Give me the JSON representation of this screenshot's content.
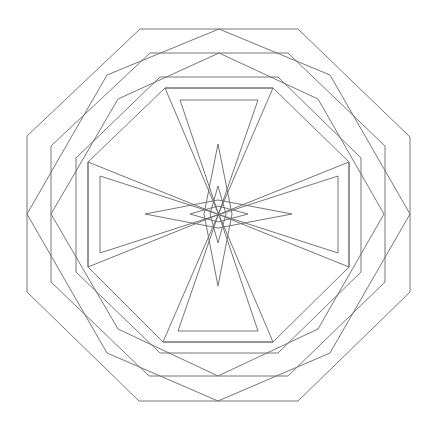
{
  "figure": {
    "stroke_color": "#666666",
    "background": "#ffffff",
    "shapes": [
      {
        "name": "outer-octagon",
        "points": "140,29 298,29 410,137 410,292 298,401 139,401 27,292 27,136"
      },
      {
        "name": "outer-rotated-octagon",
        "points": "219,29 330,75 410,214 330,353 218,401 107,353 27,214 107,75"
      },
      {
        "name": "second-octagon",
        "points": "150,53 288,53 385,146 385,282 288,376 149,376 51,282 51,146"
      },
      {
        "name": "second-rotated-octagon",
        "points": "219,53 318,99 384,214 318,329 218,376 118,329 51,214 118,99"
      },
      {
        "name": "third-octagon",
        "points": "160,77 278,77 361,158 361,272 278,353 160,353 76,272 76,158"
      },
      {
        "name": "fourth-octagon",
        "points": "165,88 273,88 349,162 349,267 273,342 163,342 88,267 88,162"
      },
      {
        "name": "vertical-hourglass-outer",
        "points": "165,88 273,88 163,342 273,342"
      },
      {
        "name": "vertical-hourglass-inner",
        "points": "180,100 258,100 178,331 258,331"
      },
      {
        "name": "horizontal-hourglass-outer",
        "points": "88,162 88,267 349,162 349,267"
      },
      {
        "name": "horizontal-hourglass-inner",
        "points": "100,176 100,253 338,176 338,253"
      },
      {
        "name": "vertical-large-diamond",
        "points": "218,144 232,214 218,286 204,214"
      },
      {
        "name": "horizontal-large-diamond",
        "points": "145,214 218,200 292,214 218,228"
      },
      {
        "name": "vertical-small-diamond",
        "points": "218,186 226,214 218,243 210,214"
      },
      {
        "name": "horizontal-small-diamond",
        "points": "190,214 218,206 248,214 218,222"
      }
    ]
  }
}
